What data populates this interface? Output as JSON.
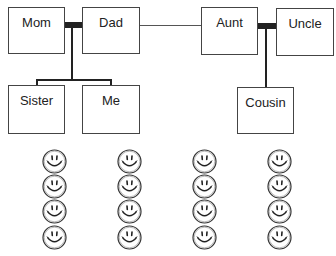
{
  "diagram": {
    "type": "family-tree",
    "people": {
      "mom": "Mom",
      "dad": "Dad",
      "aunt": "Aunt",
      "uncle": "Uncle",
      "sister": "Sister",
      "me": "Me",
      "cousin": "Cousin"
    },
    "relationships": [
      {
        "type": "couple",
        "members": [
          "Mom",
          "Dad"
        ]
      },
      {
        "type": "couple",
        "members": [
          "Aunt",
          "Uncle"
        ]
      },
      {
        "type": "sibling-link",
        "members": [
          "Dad",
          "Aunt"
        ]
      },
      {
        "type": "children",
        "parents": [
          "Mom",
          "Dad"
        ],
        "children": [
          "Sister",
          "Me"
        ]
      },
      {
        "type": "children",
        "parents": [
          "Aunt",
          "Uncle"
        ],
        "children": [
          "Cousin"
        ]
      }
    ],
    "smiley_columns": 4,
    "smileys_per_column": 4,
    "colors": {
      "line": "#222222",
      "box_border": "#444444",
      "background": "#ffffff"
    }
  }
}
